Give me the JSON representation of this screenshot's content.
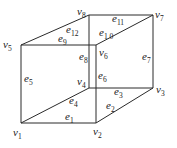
{
  "diagram": {
    "type": "cube-graph",
    "colors": {
      "stroke": "#2a2a2a",
      "text": "#222222",
      "background": "#ffffff"
    },
    "vertices": [
      {
        "id": "v1",
        "base": "v",
        "sub": "1",
        "x": 21,
        "y": 123,
        "lx": 13,
        "ly": 136
      },
      {
        "id": "v2",
        "base": "v",
        "sub": "2",
        "x": 96,
        "y": 123,
        "lx": 93,
        "ly": 135
      },
      {
        "id": "v3",
        "base": "v",
        "sub": "3",
        "x": 153,
        "y": 88,
        "lx": 156,
        "ly": 93
      },
      {
        "id": "v4",
        "base": "v",
        "sub": "4",
        "x": 89,
        "y": 88,
        "lx": 77,
        "ly": 85
      },
      {
        "id": "v5",
        "base": "v",
        "sub": "5",
        "x": 21,
        "y": 45,
        "lx": 3,
        "ly": 48
      },
      {
        "id": "v6",
        "base": "v",
        "sub": "6",
        "x": 96,
        "y": 45,
        "lx": 99,
        "ly": 56
      },
      {
        "id": "v7",
        "base": "v",
        "sub": "7",
        "x": 153,
        "y": 15,
        "lx": 155,
        "ly": 18
      },
      {
        "id": "v8",
        "base": "v",
        "sub": "8",
        "x": 89,
        "y": 15,
        "lx": 77,
        "ly": 15
      }
    ],
    "edges": [
      {
        "id": "e1",
        "base": "e",
        "sub": "1",
        "from": "v1",
        "to": "v2",
        "lx": 65,
        "ly": 120
      },
      {
        "id": "e2",
        "base": "e",
        "sub": "2",
        "from": "v2",
        "to": "v3",
        "lx": 106,
        "ly": 109
      },
      {
        "id": "e3",
        "base": "e",
        "sub": "3",
        "from": "v4",
        "to": "v3",
        "lx": 114,
        "ly": 95
      },
      {
        "id": "e4",
        "base": "e",
        "sub": "4",
        "from": "v1",
        "to": "v4",
        "lx": 69,
        "ly": 104
      },
      {
        "id": "e5",
        "base": "e",
        "sub": "5",
        "from": "v1",
        "to": "v5",
        "lx": 24,
        "ly": 82
      },
      {
        "id": "e6",
        "base": "e",
        "sub": "6",
        "from": "v2",
        "to": "v6",
        "lx": 98,
        "ly": 79
      },
      {
        "id": "e7",
        "base": "e",
        "sub": "7",
        "from": "v3",
        "to": "v7",
        "lx": 142,
        "ly": 60
      },
      {
        "id": "e8",
        "base": "e",
        "sub": "8",
        "from": "v4",
        "to": "v8",
        "lx": 79,
        "ly": 60
      },
      {
        "id": "e9",
        "base": "e",
        "sub": "9",
        "from": "v5",
        "to": "v6",
        "lx": 58,
        "ly": 42
      },
      {
        "id": "e10",
        "base": "e",
        "sub": "1 0",
        "from": "v6",
        "to": "v7",
        "lx": 99,
        "ly": 36
      },
      {
        "id": "e11",
        "base": "e",
        "sub": "11",
        "from": "v8",
        "to": "v7",
        "lx": 112,
        "ly": 22
      },
      {
        "id": "e12",
        "base": "e",
        "sub": "12",
        "from": "v5",
        "to": "v8",
        "lx": 66,
        "ly": 33
      }
    ]
  }
}
